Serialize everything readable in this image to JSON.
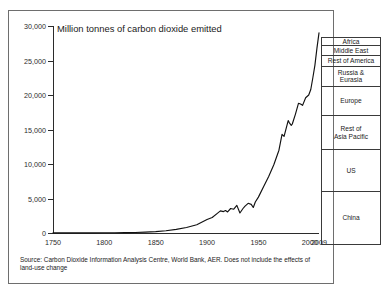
{
  "chart_data": {
    "type": "line",
    "title": "Million tonnes of carbon dioxide emitted",
    "xlabel": "",
    "ylabel": "",
    "xlim": [
      1750,
      2009
    ],
    "ylim": [
      0,
      30000
    ],
    "grid": false,
    "legend_position": "right-stacked-column",
    "y_ticks": [
      0,
      5000,
      10000,
      15000,
      20000,
      25000,
      30000
    ],
    "y_tick_labels": [
      "0",
      "5,000",
      "10,000",
      "15,000",
      "20,000",
      "25,000",
      "30,000"
    ],
    "x_ticks": [
      1750,
      1800,
      1850,
      1900,
      1950,
      2000,
      2009
    ],
    "x_tick_labels": [
      "1750",
      "1800",
      "1850",
      "1900",
      "1950",
      "2000",
      "2009"
    ],
    "series": [
      {
        "name": "Global CO2 emissions",
        "x": [
          1750,
          1760,
          1770,
          1780,
          1790,
          1800,
          1810,
          1820,
          1830,
          1840,
          1850,
          1860,
          1870,
          1880,
          1890,
          1900,
          1905,
          1910,
          1913,
          1916,
          1918,
          1920,
          1923,
          1926,
          1929,
          1932,
          1935,
          1937,
          1940,
          1943,
          1945,
          1947,
          1950,
          1955,
          1960,
          1965,
          1970,
          1973,
          1975,
          1979,
          1980,
          1982,
          1983,
          1986,
          1989,
          1991,
          1993,
          1996,
          1999,
          2001,
          2003,
          2005,
          2007,
          2009
        ],
        "values": [
          10,
          12,
          15,
          18,
          22,
          30,
          40,
          55,
          80,
          130,
          200,
          320,
          530,
          790,
          1200,
          1950,
          2250,
          2850,
          3200,
          3100,
          3250,
          3050,
          3550,
          3450,
          4000,
          2900,
          3550,
          3900,
          4300,
          4150,
          3700,
          4500,
          5200,
          6700,
          8200,
          9900,
          12000,
          14300,
          14000,
          16300,
          16000,
          15600,
          15800,
          17200,
          18800,
          18700,
          18500,
          19600,
          20000,
          20800,
          22500,
          24300,
          26800,
          29000
        ]
      }
    ],
    "regions_stacked_2009": [
      {
        "name": "China",
        "label": "China",
        "share_bottom": 0,
        "share_top": 7700
      },
      {
        "name": "US",
        "label": "US",
        "share_bottom": 7700,
        "share_top": 13600
      },
      {
        "name": "Rest of Asia Pacific",
        "label": "Rest of\nAsia Pacific",
        "share_bottom": 13600,
        "share_top": 18500
      },
      {
        "name": "Europe",
        "label": "Europe",
        "share_bottom": 18500,
        "share_top": 22600
      },
      {
        "name": "Russia & Eurasia",
        "label": "Russia &\nEurasia",
        "share_bottom": 22600,
        "share_top": 25400
      },
      {
        "name": "Rest of America",
        "label": "Rest of America",
        "share_bottom": 25400,
        "share_top": 26800
      },
      {
        "name": "Middle East",
        "label": "Middle East",
        "share_bottom": 26800,
        "share_top": 28100
      },
      {
        "name": "Africa",
        "label": "Africa",
        "share_bottom": 28100,
        "share_top": 29000
      }
    ]
  },
  "footnote": "Source: Carbon Dioxide Information Analysis Centre, World Bank, AER. Does not include the effects of land-use change"
}
